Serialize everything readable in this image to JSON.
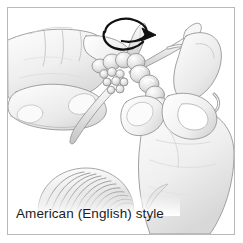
{
  "figure": {
    "caption": "American (English) style",
    "frame_border_color": "#b9b9b9",
    "background_color": "#ffffff",
    "width": 243,
    "height": 243
  },
  "illustration": {
    "title": "Hands knitting in American English style",
    "description": "Grayscale line illustration of two hands holding knitting needles with a chain of stitches, a curved rotation arrow at the right needle tip, and a ball of yarn at lower left.",
    "line_color": "#6f6f6f",
    "shade_light": "#f2f2f2",
    "shade_mid": "#dcdcdc",
    "shade_dark": "#b4b4b4",
    "arrow_color": "#1a1a1a",
    "elements": [
      {
        "name": "left-hand",
        "label": "Left hand holding needle"
      },
      {
        "name": "right-hand",
        "label": "Right hand wrapping yarn"
      },
      {
        "name": "left-needle",
        "label": "Left knitting needle"
      },
      {
        "name": "right-needle",
        "label": "Right knitting needle"
      },
      {
        "name": "stitch-chain",
        "label": "Chain of knit stitches on needle"
      },
      {
        "name": "yarn-strand",
        "label": "Working yarn strand"
      },
      {
        "name": "rotation-arrow",
        "label": "Curved arrow showing yarn wrap direction"
      },
      {
        "name": "yarn-ball",
        "label": "Ball of yarn"
      }
    ]
  }
}
